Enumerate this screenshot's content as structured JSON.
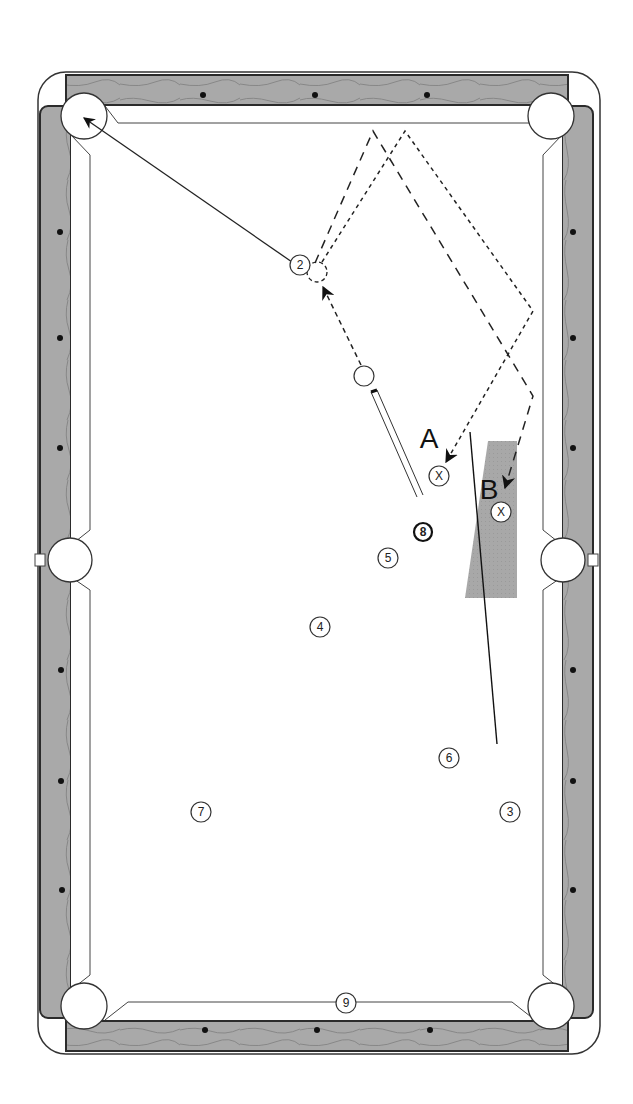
{
  "diagram": {
    "type": "pool-shot-diagram",
    "colors": {
      "rail": "#a9a9a9",
      "rail_edge": "#2b2b2b",
      "felt": "#ffffff",
      "line": "#222222",
      "shaded_zone": "#a8a8a8",
      "diamond": "#111111"
    },
    "labels": {
      "position_a": "A",
      "position_b": "B"
    },
    "balls": [
      {
        "id": "2",
        "label": "2",
        "x": 300,
        "y": 265,
        "style": "plain"
      },
      {
        "id": "8",
        "label": "8",
        "x": 423,
        "y": 532,
        "style": "bold"
      },
      {
        "id": "5",
        "label": "5",
        "x": 388,
        "y": 558,
        "style": "plain"
      },
      {
        "id": "4",
        "label": "4",
        "x": 320,
        "y": 627,
        "style": "plain"
      },
      {
        "id": "6",
        "label": "6",
        "x": 449,
        "y": 758,
        "style": "plain"
      },
      {
        "id": "3",
        "label": "3",
        "x": 510,
        "y": 812,
        "style": "plain"
      },
      {
        "id": "7",
        "label": "7",
        "x": 201,
        "y": 812,
        "style": "plain"
      },
      {
        "id": "9",
        "label": "9",
        "x": 346,
        "y": 1003,
        "style": "plain"
      }
    ],
    "targets": [
      {
        "id": "target-a",
        "label": "X",
        "x": 439,
        "y": 476
      },
      {
        "id": "target-b",
        "label": "X",
        "x": 501,
        "y": 512
      }
    ],
    "cue_ball": {
      "x": 364,
      "y": 376
    },
    "pockets": [
      {
        "id": "top-left",
        "x": 84,
        "y": 116
      },
      {
        "id": "top-right",
        "x": 551,
        "y": 116
      },
      {
        "id": "middle-left",
        "x": 70,
        "y": 560
      },
      {
        "id": "middle-right",
        "x": 563,
        "y": 560
      },
      {
        "id": "bottom-left",
        "x": 84,
        "y": 1006
      },
      {
        "id": "bottom-right",
        "x": 551,
        "y": 1006
      }
    ],
    "diamonds": {
      "top": [
        203,
        315,
        427
      ],
      "bottom": [
        205,
        317,
        430
      ],
      "left": [
        232,
        338,
        448,
        670,
        781,
        890
      ],
      "right": [
        232,
        338,
        448,
        670,
        781,
        890
      ]
    }
  }
}
